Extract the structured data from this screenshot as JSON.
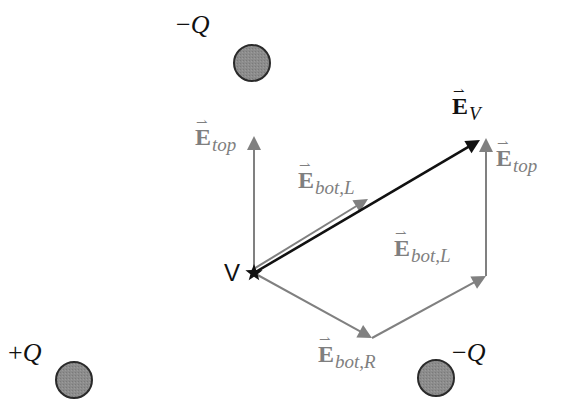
{
  "diagram": {
    "colors": {
      "charge_fill": "#8a8a8a",
      "charge_stroke": "#2a2a2a",
      "component_vector": "#808080",
      "resultant_vector": "#111111"
    },
    "charges": [
      {
        "id": "top",
        "sign": "−",
        "symbol": "Q",
        "cx": 252,
        "cy": 63,
        "r": 18,
        "label_x": 176,
        "label_y": 12
      },
      {
        "id": "bottom-left",
        "sign": "+",
        "symbol": "Q",
        "cx": 74,
        "cy": 380,
        "r": 18,
        "label_x": 8,
        "label_y": 340
      },
      {
        "id": "bottom-right",
        "sign": "−",
        "symbol": "Q",
        "cx": 436,
        "cy": 378,
        "r": 18,
        "label_x": 452,
        "label_y": 340
      }
    ],
    "point": {
      "label": "V",
      "x": 254,
      "y": 273,
      "marker": "star"
    },
    "vectors": [
      {
        "id": "E_top_left",
        "symbol": "E",
        "subscript": "top",
        "from": [
          254,
          273
        ],
        "to": [
          254,
          136
        ],
        "style": "component",
        "label_x": 195,
        "label_y": 125
      },
      {
        "id": "E_botL_left",
        "symbol": "E",
        "subscript": "bot,L",
        "from": [
          254,
          273
        ],
        "to": [
          370,
          202
        ],
        "style": "component",
        "label_x": 298,
        "label_y": 168
      },
      {
        "id": "E_botR",
        "symbol": "E",
        "subscript": "bot,R",
        "from": [
          254,
          273
        ],
        "to": [
          372,
          338
        ],
        "style": "component",
        "label_x": 318,
        "label_y": 342
      },
      {
        "id": "E_botL_chain",
        "symbol": "E",
        "subscript": "bot,L",
        "from": [
          372,
          338
        ],
        "to": [
          486,
          276
        ],
        "style": "component",
        "label_x": 394,
        "label_y": 236
      },
      {
        "id": "E_top_chain",
        "symbol": "E",
        "subscript": "top",
        "from": [
          486,
          276
        ],
        "to": [
          486,
          138
        ],
        "style": "component",
        "label_x": 496,
        "label_y": 146
      },
      {
        "id": "E_V",
        "symbol": "E",
        "subscript": "V",
        "from": [
          254,
          273
        ],
        "to": [
          480,
          140
        ],
        "style": "resultant",
        "label_x": 452,
        "label_y": 94
      }
    ]
  }
}
